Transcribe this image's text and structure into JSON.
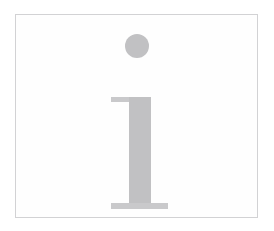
{
  "image": {
    "kind": "glyph-illustration",
    "subject": "lowercase-serif-letter-i",
    "alt_text": "i",
    "caption": ""
  },
  "frame": {
    "border_color": "#d2d2d4",
    "fill_color": "#fefefe",
    "x": 15,
    "y": 14,
    "width": 243,
    "height": 204
  },
  "background": {
    "color": "#ffffff"
  },
  "glyph": {
    "character": "i",
    "color": "#c1c1c3",
    "serif_color": "#c9c9cb",
    "parts": {
      "tittle": {
        "name": "dot",
        "shape": "circle",
        "diameter": 24,
        "center_x": 136,
        "center_y": 45
      },
      "stem": {
        "name": "stem",
        "shape": "rectangle",
        "x": 128,
        "y": 96,
        "width": 22,
        "height": 112
      },
      "top_serif": {
        "name": "top-flag-serif",
        "shape": "rectangle",
        "x": 110,
        "y": 96,
        "width": 40,
        "height": 5
      },
      "foot_serif": {
        "name": "foot-serif",
        "shape": "rectangle",
        "x": 110,
        "y": 202,
        "width": 57,
        "height": 6
      }
    }
  }
}
